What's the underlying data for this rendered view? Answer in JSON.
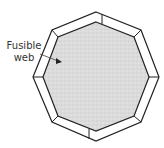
{
  "diagram": {
    "label_line1": "Fusible",
    "label_line2": "web",
    "shape": "octagon",
    "colors": {
      "fill": "#dcdcdc",
      "frame": "#ffffff",
      "stroke": "#222222",
      "text": "#333333"
    }
  }
}
